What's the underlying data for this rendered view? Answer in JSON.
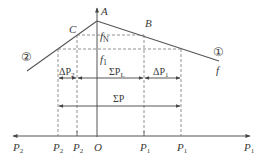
{
  "diagram": {
    "type": "frequency-power characteristic of two interconnected systems",
    "colors": {
      "line": "#555555",
      "dash": "#777777",
      "text": "#3a3a3a",
      "background": "#ffffff"
    },
    "points": {
      "peak": "A",
      "left_point": "C",
      "right_point": "B"
    },
    "curve_labels": {
      "left": "②",
      "right": "①",
      "right_end": "f"
    },
    "level_labels": {
      "fN": "f",
      "fN_sub": "N",
      "f1": "f",
      "f1_sub": "1"
    },
    "spans": {
      "delta_p2": {
        "prefix": "ΔP",
        "sub": "2"
      },
      "sum_pl": {
        "prefix": "ΣP",
        "sub": "L"
      },
      "delta_p1": {
        "prefix": "ΔP",
        "sub": "1"
      },
      "sum_p": {
        "label": "ΣP"
      }
    },
    "axis_labels": [
      {
        "id": "left-end",
        "text": "P",
        "sub": "2"
      },
      {
        "id": "p2-prime",
        "text": "P",
        "sub": "2"
      },
      {
        "id": "p2",
        "text": "P",
        "sub": "2"
      },
      {
        "id": "origin",
        "text": "O",
        "sub": ""
      },
      {
        "id": "p1",
        "text": "P",
        "sub": "1"
      },
      {
        "id": "p1-prime",
        "text": "P",
        "sub": "1"
      },
      {
        "id": "right-end",
        "text": "P",
        "sub": "1"
      }
    ]
  }
}
